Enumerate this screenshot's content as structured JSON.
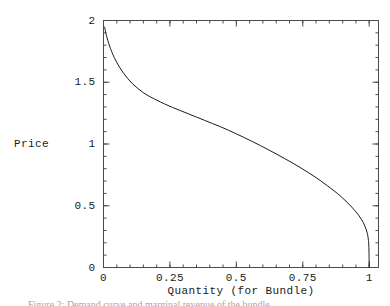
{
  "figure": {
    "background_color": "#ffffff",
    "frame_color": "#4a4a4a",
    "curve_color": "#1a1a1a"
  },
  "caption": {
    "text": "Figure 2: Demand curve and marginal revenue of the bundle"
  },
  "chart_data": {
    "type": "line",
    "title": "",
    "subtitle": "",
    "xlabel": "Quantity (for Bundle)",
    "ylabel": "Price",
    "xlim": [
      0,
      1.035
    ],
    "ylim": [
      0,
      2
    ],
    "grid": false,
    "legend": null,
    "frame": true,
    "xticks": [
      0,
      0.25,
      0.5,
      0.75,
      1
    ],
    "xticklabels": [
      "0",
      "0.25",
      "0.5",
      "0.75",
      "1"
    ],
    "xminortick_step": 0.05,
    "yticks": [
      0,
      0.5,
      1,
      1.5,
      2
    ],
    "yticklabels": [
      "0",
      "0.5",
      "1",
      "1.5",
      "2"
    ],
    "yminortick_step": 0.1,
    "series": [
      {
        "name": "Bundle demand curve",
        "x": [
          0.004,
          0.008,
          0.012,
          0.016,
          0.02,
          0.026,
          0.032,
          0.04,
          0.05,
          0.062,
          0.076,
          0.092,
          0.11,
          0.13,
          0.152,
          0.176,
          0.2,
          0.23,
          0.26,
          0.29,
          0.32,
          0.35,
          0.38,
          0.41,
          0.44,
          0.47,
          0.5,
          0.53,
          0.56,
          0.59,
          0.62,
          0.65,
          0.68,
          0.71,
          0.74,
          0.77,
          0.8,
          0.83,
          0.855,
          0.88,
          0.9,
          0.918,
          0.934,
          0.948,
          0.96,
          0.97,
          0.978,
          0.984,
          0.989,
          0.993,
          0.996,
          0.998,
          0.9993,
          1.0
        ],
        "y": [
          1.95,
          1.905,
          1.87,
          1.84,
          1.812,
          1.775,
          1.742,
          1.702,
          1.66,
          1.616,
          1.572,
          1.528,
          1.486,
          1.448,
          1.412,
          1.382,
          1.356,
          1.324,
          1.296,
          1.27,
          1.244,
          1.218,
          1.192,
          1.166,
          1.14,
          1.112,
          1.082,
          1.052,
          1.02,
          0.988,
          0.954,
          0.92,
          0.884,
          0.848,
          0.81,
          0.77,
          0.728,
          0.682,
          0.642,
          0.6,
          0.562,
          0.526,
          0.49,
          0.456,
          0.424,
          0.392,
          0.362,
          0.334,
          0.306,
          0.276,
          0.24,
          0.196,
          0.12,
          0.0
        ]
      }
    ]
  }
}
